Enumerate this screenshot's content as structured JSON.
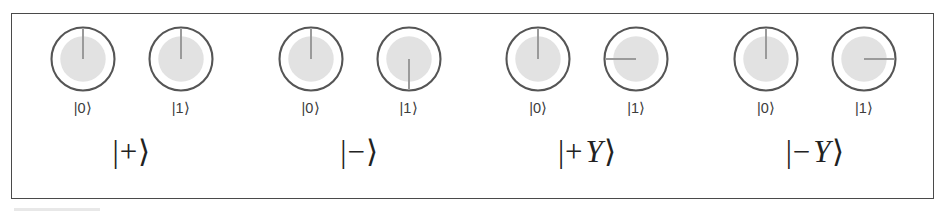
{
  "figure": {
    "kind": "quantum-amplitude-dials",
    "border_color": "#4a4a4a",
    "background": "#ffffff",
    "dial_ring_color": "#555555",
    "dial_disc_color": "#e2e2e2",
    "dial_needle_color": "#9a9a9a"
  },
  "basis_labels": {
    "zero": "|0⟩",
    "one": "|1⟩"
  },
  "chart_data": {
    "type": "table",
    "title": "",
    "angle_convention": "degrees clockwise from straight up (12 o'clock)",
    "categories": [
      "|+⟩",
      "|−⟩",
      "|+Y⟩",
      "|−Y⟩"
    ],
    "series": [
      {
        "name": "|0⟩ phase angle",
        "values": [
          0,
          0,
          0,
          0
        ]
      },
      {
        "name": "|1⟩ phase angle",
        "values": [
          0,
          180,
          270,
          90
        ]
      },
      {
        "name": "|0⟩ magnitude",
        "values": [
          0.707,
          0.707,
          0.707,
          0.707
        ]
      },
      {
        "name": "|1⟩ magnitude",
        "values": [
          0.707,
          0.707,
          0.707,
          0.707
        ]
      }
    ]
  },
  "groups": [
    {
      "name": "plus-state",
      "label_parts": {
        "bar": "|",
        "sign": "+",
        "sym": "",
        "close": "⟩"
      },
      "label_text": "|+⟩",
      "dials": [
        {
          "basis": "|0⟩",
          "angle_deg": 0,
          "magnitude": 0.707
        },
        {
          "basis": "|1⟩",
          "angle_deg": 0,
          "magnitude": 0.707
        }
      ]
    },
    {
      "name": "minus-state",
      "label_parts": {
        "bar": "|",
        "sign": "−",
        "sym": "",
        "close": "⟩"
      },
      "label_text": "|−⟩",
      "dials": [
        {
          "basis": "|0⟩",
          "angle_deg": 0,
          "magnitude": 0.707
        },
        {
          "basis": "|1⟩",
          "angle_deg": 180,
          "magnitude": 0.707
        }
      ]
    },
    {
      "name": "plus-y-state",
      "label_parts": {
        "bar": "|",
        "sign": "+",
        "sym": "Y",
        "close": "⟩"
      },
      "label_text": "|+Y⟩",
      "dials": [
        {
          "basis": "|0⟩",
          "angle_deg": 0,
          "magnitude": 0.707
        },
        {
          "basis": "|1⟩",
          "angle_deg": 270,
          "magnitude": 0.707
        }
      ]
    },
    {
      "name": "minus-y-state",
      "label_parts": {
        "bar": "|",
        "sign": "−",
        "sym": "Y",
        "close": "⟩"
      },
      "label_text": "|−Y⟩",
      "dials": [
        {
          "basis": "|0⟩",
          "angle_deg": 0,
          "magnitude": 0.707
        },
        {
          "basis": "|1⟩",
          "angle_deg": 90,
          "magnitude": 0.707
        }
      ]
    }
  ]
}
